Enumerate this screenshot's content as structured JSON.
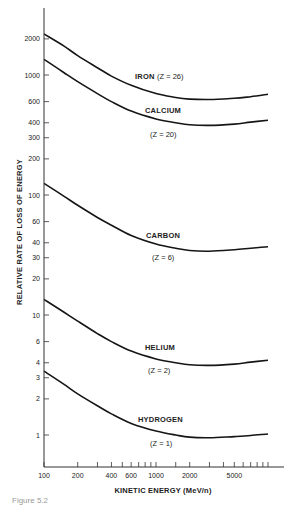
{
  "chart_data": {
    "type": "line",
    "title": "",
    "xlabel": "KINETIC ENERGY (MeV/n)",
    "ylabel": "RELATIVE RATE OF LOSS OF ENERGY",
    "xscale": "log",
    "yscale": "log",
    "xlim": [
      100,
      10000
    ],
    "ylim": [
      0.7,
      3500
    ],
    "grid": false,
    "legend": "inline labels",
    "x_tick_labels": [
      "100",
      "200",
      "400",
      "600",
      "1000",
      "2000",
      "5000"
    ],
    "x_ticks": [
      100,
      200,
      300,
      400,
      500,
      600,
      700,
      800,
      900,
      1000,
      1500,
      2000,
      3000,
      4000,
      5000,
      6000,
      7000,
      8000,
      9000,
      10000
    ],
    "y_tick_labels": [
      "1",
      "2",
      "3",
      "4",
      "6",
      "10",
      "20",
      "30",
      "40",
      "60",
      "100",
      "200",
      "300",
      "400",
      "600",
      "1000",
      "2000"
    ],
    "y_ticks": [
      1,
      2,
      3,
      4,
      6,
      10,
      20,
      30,
      40,
      60,
      100,
      200,
      300,
      400,
      600,
      1000,
      2000
    ],
    "x": [
      100,
      150,
      200,
      300,
      400,
      600,
      1000,
      1500,
      2000,
      3000,
      5000,
      7000,
      10000
    ],
    "series": [
      {
        "name": "IRON",
        "z_label": "(Z = 26)",
        "values": [
          2200,
          1750,
          1450,
          1150,
          980,
          820,
          700,
          650,
          630,
          625,
          640,
          660,
          690
        ]
      },
      {
        "name": "CALCIUM",
        "z_label": "(Z = 20)",
        "values": [
          1350,
          1050,
          880,
          700,
          600,
          500,
          430,
          400,
          385,
          380,
          390,
          405,
          420
        ]
      },
      {
        "name": "CARBON",
        "z_label": "(Z = 6)",
        "values": [
          125,
          98,
          82,
          65,
          56,
          46,
          39,
          36,
          34.5,
          34,
          35,
          36,
          37
        ]
      },
      {
        "name": "HELIUM",
        "z_label": "(Z = 2)",
        "values": [
          13.5,
          10.6,
          8.9,
          7.0,
          6.0,
          5.0,
          4.3,
          4.0,
          3.85,
          3.8,
          3.9,
          4.05,
          4.2
        ]
      },
      {
        "name": "HYDROGEN",
        "z_label": "(Z = 1)",
        "values": [
          3.4,
          2.65,
          2.2,
          1.75,
          1.5,
          1.25,
          1.08,
          1.0,
          0.96,
          0.95,
          0.97,
          0.99,
          1.02
        ]
      }
    ]
  },
  "axes": {
    "xlabel": "KINETIC ENERGY (MeV/n)",
    "ylabel": "RELATIVE RATE OF LOSS OF ENERGY"
  },
  "labels": {
    "iron": "IRON",
    "iron_z": "(Z = 26)",
    "calcium": "CALCIUM",
    "calcium_z": "(Z = 20)",
    "carbon": "CARBON",
    "carbon_z": "(Z = 6)",
    "helium": "HELIUM",
    "helium_z": "(Z = 2)",
    "hydrogen": "HYDROGEN",
    "hydrogen_z": "(Z = 1)"
  },
  "caption": "Figure 5.2"
}
